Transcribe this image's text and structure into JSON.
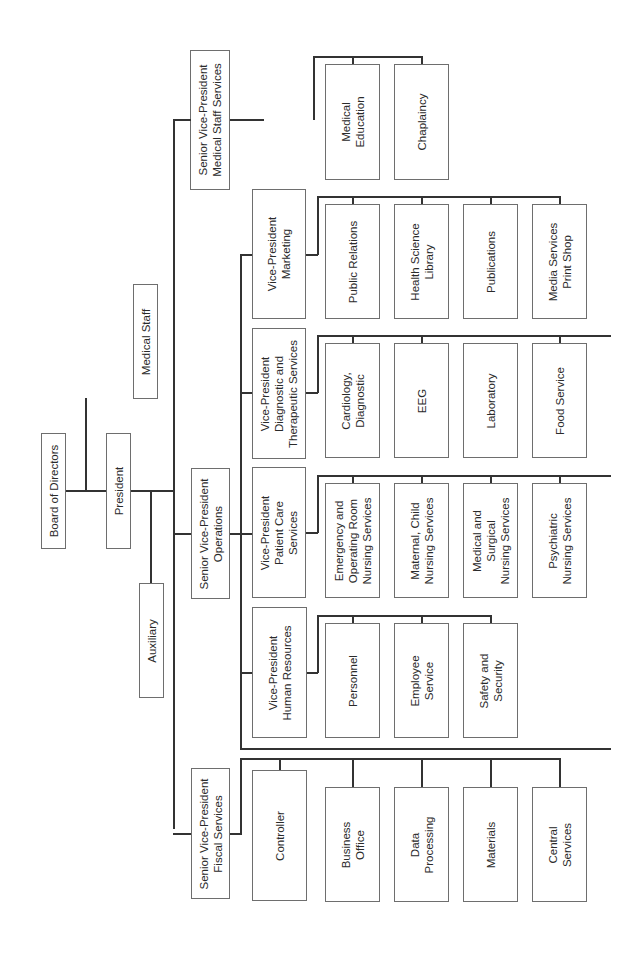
{
  "chart_title": "",
  "root": {
    "board": "Board of Directors",
    "medical_staff": "Medical Staff",
    "president": "President",
    "auxiliary": "Auxiliary"
  },
  "svp": {
    "medical_staff_services": "Senior Vice-President\nMedical Staff Services",
    "operations": "Senior Vice-President\nOperations",
    "fiscal_services": "Senior Vice-President\nFiscal Services"
  },
  "medical_staff_services_units": [
    "Medical\nEducation",
    "Chaplaincy"
  ],
  "vp": {
    "marketing": "Vice-President\nMarketing",
    "diagnostic": "Vice-President\nDiagnostic and\nTherapeutic Services",
    "patient_care": "Vice-President\nPatient Care\nServices",
    "human_resources": "Vice-President\nHuman Resources"
  },
  "marketing_units": [
    "Public Relations",
    "Health Science\nLibrary",
    "Publications",
    "Media Services\nPrint Shop"
  ],
  "diagnostic_units": [
    "Cardiology,\nDiagnostic",
    "EEG",
    "Laboratory",
    "Food Service"
  ],
  "patient_care_units": [
    "Emergency and\nOperating Room\nNursing Services",
    "Maternal, Child\nNursing Services",
    "Medical and\nSurgical\nNursing Services",
    "Psychiatric\nNursing Services"
  ],
  "human_resources_units": [
    "Personnel",
    "Employee\nService",
    "Safety and\nSecurity"
  ],
  "fiscal_units": [
    "Controller",
    "Business\nOffice",
    "Data\nProcessing",
    "Materials",
    "Central\nServices"
  ],
  "colors": {
    "line": "#333333",
    "box_border": "#6e6e6e",
    "background": "#ffffff"
  }
}
